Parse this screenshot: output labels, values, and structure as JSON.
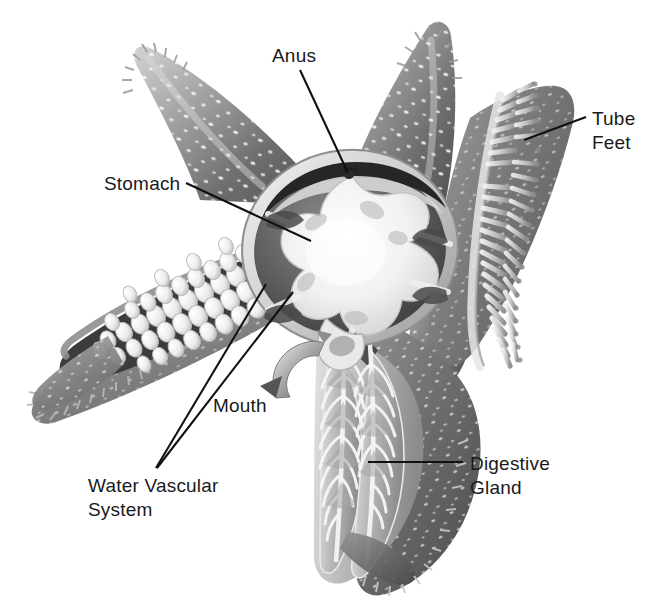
{
  "figure": {
    "background_color": "#ffffff",
    "line_color": "#111111",
    "text_color": "#1a1a1a",
    "width": 660,
    "height": 601
  },
  "labels": [
    {
      "id": "anus",
      "name": "Anus",
      "lines": [
        "Anus"
      ],
      "text_x": 272,
      "text_y": 62,
      "anchor": "start",
      "leader": [
        [
          300,
          70
        ],
        [
          348,
          173
        ]
      ]
    },
    {
      "id": "tube-feet",
      "name": "Tube Feet",
      "lines": [
        "Tube",
        "Feet"
      ],
      "text_x": 592,
      "text_y": 125,
      "anchor": "start",
      "leader": [
        [
          586,
          117
        ],
        [
          524,
          140
        ]
      ]
    },
    {
      "id": "stomach",
      "name": "Stomach",
      "lines": [
        "Stomach"
      ],
      "text_x": 104,
      "text_y": 190,
      "anchor": "start",
      "leader": [
        [
          186,
          183
        ],
        [
          311,
          241
        ]
      ]
    },
    {
      "id": "mouth",
      "name": "Mouth",
      "lines": [
        "Mouth"
      ],
      "text_x": 213,
      "text_y": 412,
      "anchor": "start",
      "leader": []
    },
    {
      "id": "water-vascular-system",
      "name": "Water Vascular System",
      "lines": [
        "Water Vascular",
        "System"
      ],
      "text_x": 88,
      "text_y": 492,
      "anchor": "start",
      "leader": [
        [
          156,
          468
        ],
        [
          266,
          284
        ]
      ],
      "leader2": [
        [
          157,
          468
        ],
        [
          293,
          292
        ]
      ]
    },
    {
      "id": "digestive-gland",
      "name": "Digestive Gland",
      "lines": [
        "Digestive",
        "Gland"
      ],
      "text_x": 470,
      "text_y": 470,
      "anchor": "start",
      "leader": [
        [
          368,
          462
        ],
        [
          463,
          462
        ]
      ]
    }
  ],
  "structures": {
    "arms": [
      {
        "id": "arm-upper-left",
        "name": "upper-left-arm",
        "description": "intact aboral arm with spines"
      },
      {
        "id": "arm-upper-right",
        "name": "upper-right-arm",
        "description": "intact aboral arm with spines"
      },
      {
        "id": "arm-right-tube-feet",
        "name": "right-arm-tube-feet",
        "description": "arm showing oral surface with tube feet"
      },
      {
        "id": "arm-left-ampullae",
        "name": "left-arm-water-vascular",
        "description": "dissected arm showing ampullae of water vascular system"
      },
      {
        "id": "arm-lower-digestive",
        "name": "lower-arm-digestive-gland",
        "description": "dissected arm showing paired digestive glands"
      }
    ],
    "central_disc": {
      "id": "central-disc",
      "name": "central-disc-stomach",
      "description": "cut-open central disc exposing cardiac stomach and ring canal"
    },
    "mouth_arrow": {
      "id": "mouth-arrow",
      "name": "mouth-cutaway-arrow",
      "description": "curved arrow indicating the mouth on the oral surface"
    }
  },
  "palette": {
    "arm_dark": "#5d5d5d",
    "arm_mid": "#8a8a8a",
    "arm_light": "#c9c9c9",
    "arm_pale": "#e2e2e2",
    "cavity_dark": "#3a3a3a",
    "stomach_white": "#fafafa",
    "gland_grey": "#b4b4b4",
    "ampulla_white": "#f4f4f4",
    "spine_white": "#ffffff"
  }
}
